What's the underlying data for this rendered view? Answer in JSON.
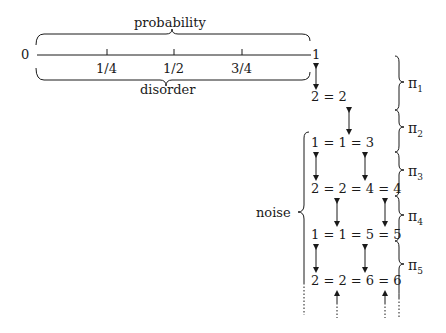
{
  "number_line": {
    "start_label": "0",
    "end_label": "1",
    "ticks": [
      "1/4",
      "1/2",
      "3/4"
    ],
    "top_brace_label": "probability",
    "bottom_brace_label": "disorder"
  },
  "sequence_rows": [
    "2 = 2",
    "1 = 1 = 3",
    "2 = 2 = 4 = 4",
    "1 = 1 = 5 = 5",
    "2 = 2 = 6 = 6"
  ],
  "left_brace_label": "noise",
  "right_braces": [
    {
      "symbol": "π",
      "sub": "1"
    },
    {
      "symbol": "π",
      "sub": "2"
    },
    {
      "symbol": "π",
      "sub": "3"
    },
    {
      "symbol": "π",
      "sub": "4"
    },
    {
      "symbol": "π",
      "sub": "5"
    }
  ],
  "colors": {
    "ink": "#1a1a1a",
    "background": "#ffffff"
  }
}
